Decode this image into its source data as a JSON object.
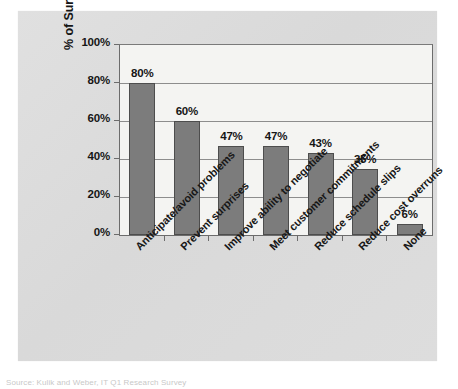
{
  "chart_data": {
    "type": "bar",
    "title": "",
    "subtitle": "",
    "xlabel": "",
    "ylabel": "% of Survey Respondents",
    "ylim": [
      0,
      100
    ],
    "yticks": [
      "0%",
      "20%",
      "40%",
      "60%",
      "80%",
      "100%"
    ],
    "ytick_values": [
      0,
      20,
      40,
      60,
      80,
      100
    ],
    "grid": "horizontal",
    "legend": "none",
    "categories": [
      "Anticipate/avoid problems",
      "Prevent surprises",
      "Improve ability to negotiate",
      "Meet customer commitments",
      "Reduce schedule slips",
      "Reduce cost overruns",
      "None"
    ],
    "values": [
      80,
      60,
      47,
      47,
      43,
      35,
      6
    ],
    "data_labels": [
      "80%",
      "60%",
      "47%",
      "47%",
      "43%",
      "35%",
      "6%"
    ],
    "bar_color": "#7c7c7c",
    "bar_border_color": "#4d4d4d",
    "plot_background": "#f4f4f2",
    "card_background": "#dcdcdc",
    "gridline_color": "#8d8d8d",
    "axis_color": "#6c6c6c"
  },
  "caption": {
    "source_text": "Source: Kulik and Weber, IT Q1 Research Survey"
  }
}
